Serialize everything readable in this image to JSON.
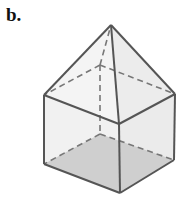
{
  "figure": {
    "label": "b.",
    "colors": {
      "edge": "#555555",
      "hidden_edge": "#777777",
      "face_fill": "#f2f2f2",
      "base_fill": "#cfcfcf"
    }
  }
}
